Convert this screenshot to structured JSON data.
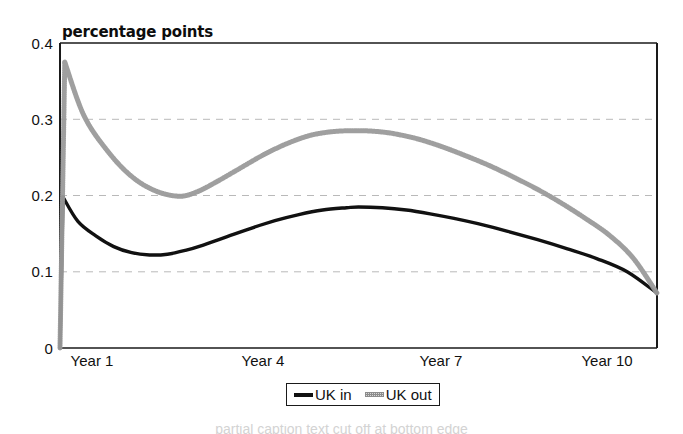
{
  "chart_data": {
    "type": "line",
    "title": "percentage points",
    "xlabel": "",
    "ylabel": "percentage points",
    "xlim": [
      1,
      11
    ],
    "ylim": [
      0,
      0.4
    ],
    "grid": true,
    "gridlines_y": [
      0.1,
      0.2,
      0.3
    ],
    "legend_position": "bottom-center",
    "y_ticks": [
      "0",
      "0.1",
      "0.2",
      "0.3",
      "0.4"
    ],
    "y_tick_values": [
      0,
      0.1,
      0.2,
      0.3,
      0.4
    ],
    "x_ticks": [
      "Year 1",
      "Year 4",
      "Year 7",
      "Year 10"
    ],
    "x_tick_values": [
      1,
      4,
      7,
      10
    ],
    "series": [
      {
        "name": "UK in",
        "color": "#111111",
        "style": "solid",
        "x": [
          1.0,
          1.05,
          1.3,
          1.6,
          1.9,
          2.2,
          2.5,
          2.8,
          3.1,
          3.4,
          3.8,
          4.2,
          4.6,
          5.0,
          5.4,
          5.8,
          6.0,
          6.4,
          6.8,
          7.2,
          7.6,
          8.0,
          8.5,
          9.0,
          9.5,
          10.0,
          10.5,
          11.0
        ],
        "values": [
          0.0,
          0.198,
          0.166,
          0.147,
          0.133,
          0.125,
          0.122,
          0.123,
          0.128,
          0.135,
          0.146,
          0.157,
          0.167,
          0.175,
          0.181,
          0.184,
          0.185,
          0.184,
          0.181,
          0.176,
          0.17,
          0.163,
          0.153,
          0.142,
          0.13,
          0.117,
          0.1,
          0.072
        ]
      },
      {
        "name": "UK out",
        "color": "#9a9a9a",
        "style": "dotted",
        "x": [
          1.0,
          1.08,
          1.4,
          1.8,
          2.2,
          2.6,
          3.0,
          3.3,
          3.6,
          4.0,
          4.4,
          4.8,
          5.2,
          5.6,
          6.0,
          6.3,
          6.6,
          7.0,
          7.4,
          7.8,
          8.2,
          8.6,
          9.0,
          9.4,
          9.8,
          10.2,
          10.6,
          11.0
        ],
        "values": [
          0.0,
          0.375,
          0.305,
          0.258,
          0.225,
          0.206,
          0.199,
          0.205,
          0.217,
          0.235,
          0.253,
          0.268,
          0.279,
          0.284,
          0.285,
          0.284,
          0.281,
          0.274,
          0.264,
          0.252,
          0.239,
          0.224,
          0.208,
          0.19,
          0.17,
          0.148,
          0.118,
          0.072
        ]
      }
    ]
  },
  "legend": {
    "items": [
      {
        "label": "UK in",
        "style": "solid"
      },
      {
        "label": "UK out",
        "style": "dotted"
      }
    ]
  },
  "caption": {
    "partial_text": "partial caption text cut off at bottom edge"
  }
}
